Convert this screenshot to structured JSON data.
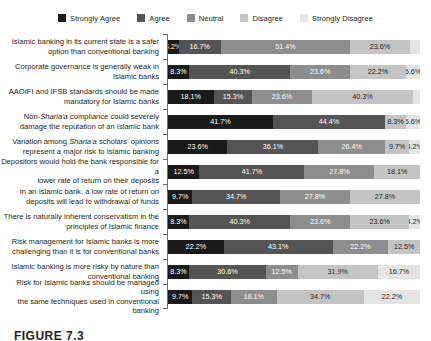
{
  "caption": "FIGURE 7.3",
  "legend": {
    "position": "top-center",
    "items": [
      {
        "label": "Strongly Agree",
        "color": "#1a1a1a"
      },
      {
        "label": "Agree",
        "color": "#545454"
      },
      {
        "label": "Neutral",
        "color": "#8d8d8d"
      },
      {
        "label": "Disagree",
        "color": "#c4c4c4"
      },
      {
        "label": "Strongly Disagree",
        "color": "#e4e4e4"
      }
    ]
  },
  "chart_data": {
    "type": "bar",
    "orientation": "horizontal",
    "stacked": true,
    "stacked_mode": "percent",
    "title": "",
    "xlabel": "",
    "ylabel": "",
    "xlim": [
      0,
      100
    ],
    "grid": false,
    "legend_position": "top-center",
    "series": [
      {
        "name": "Strongly Agree",
        "color": "#1a1a1a",
        "label_color": "#ffffff",
        "values": [
          4.2,
          8.3,
          18.1,
          41.7,
          23.6,
          12.5,
          9.7,
          8.3,
          22.2,
          8.3,
          9.7
        ]
      },
      {
        "name": "Agree",
        "color": "#545454",
        "label_color": "#ffffff",
        "values": [
          16.7,
          40.3,
          15.3,
          44.4,
          36.1,
          41.7,
          34.7,
          40.3,
          43.1,
          30.6,
          15.3
        ]
      },
      {
        "name": "Neutral",
        "color": "#8d8d8d",
        "label_color": "#ffffff",
        "values": [
          51.4,
          23.6,
          23.6,
          0.0,
          26.4,
          27.8,
          27.8,
          23.6,
          22.2,
          12.5,
          18.1
        ]
      },
      {
        "name": "Disagree",
        "color": "#c4c4c4",
        "label_color": "#231f20",
        "values": [
          23.6,
          22.2,
          40.3,
          8.3,
          9.7,
          18.1,
          27.8,
          23.6,
          12.5,
          31.9,
          34.7
        ]
      },
      {
        "name": "Strongly Disagree",
        "color": "#e4e4e4",
        "label_color": "#231f20",
        "values": [
          4.1,
          5.6,
          2.7,
          5.6,
          4.2,
          0.0,
          0.0,
          4.2,
          0.0,
          16.7,
          22.2
        ]
      }
    ],
    "categories": [
      "Islamic banking in its current state is a safer option than conventional banking",
      "Corporate governance is generally weak in Islamic banks",
      "AAOIFI and IFSB standards should be made mandatory for Islamic banks",
      "Non-Sharia'a compliance could severely damage the reputation of an Islamic bank",
      "Variation among Sharia'a scholars' opinions represent a major risk to Islamic banking",
      "Depositors would hold the bank responsible for a lower rate of return on their deposits",
      "In an Islamic bank, a low rate of return on deposits will lead to withdrawal of funds",
      "There is naturally inherent conservatism in the principles of Islamic finance",
      "Risk management for Islamic banks is more challenging than it is for conventional banks",
      "Islamic banking is more risky by nature than conventional banking",
      "Risk for Islamic banks should be managed using the same techniques used in conventional banking"
    ]
  },
  "rows": [
    {
      "label_html": "Islamic banking in its current state is a safer<br>option than conventional banking",
      "segments": [
        {
          "series": "Strongly Agree",
          "value": 4.2,
          "text": "4.2%"
        },
        {
          "series": "Agree",
          "value": 16.7,
          "text": "16.7%"
        },
        {
          "series": "Neutral",
          "value": 51.4,
          "text": "51.4%"
        },
        {
          "series": "Disagree",
          "value": 23.6,
          "text": "23.6%"
        },
        {
          "series": "Strongly Disagree",
          "value": 4.1,
          "text": ""
        }
      ]
    },
    {
      "label_html": "Corporate governance is generally weak in<br>Islamic banks",
      "segments": [
        {
          "series": "Strongly Agree",
          "value": 8.3,
          "text": "8.3%"
        },
        {
          "series": "Agree",
          "value": 40.3,
          "text": "40.3%"
        },
        {
          "series": "Neutral",
          "value": 23.6,
          "text": "23.6%"
        },
        {
          "series": "Disagree",
          "value": 22.2,
          "text": "22.2%"
        },
        {
          "series": "Strongly Disagree",
          "value": 5.6,
          "text": "5.6%"
        }
      ]
    },
    {
      "label_html": "AAOIFI and IFSB standards should be made<br>mandatory for Islamic banks",
      "segments": [
        {
          "series": "Strongly Agree",
          "value": 18.1,
          "text": "18.1%"
        },
        {
          "series": "Agree",
          "value": 15.3,
          "text": "15.3%"
        },
        {
          "series": "Neutral",
          "value": 23.6,
          "text": "23.6%"
        },
        {
          "series": "Disagree",
          "value": 40.3,
          "text": "40.3%"
        },
        {
          "series": "Strongly Disagree",
          "value": 2.7,
          "text": ""
        }
      ]
    },
    {
      "label_html": "Non-<i>Sharia'a</i> compliance could severely<br>damage the reputation of an Islamic bank",
      "segments": [
        {
          "series": "Strongly Agree",
          "value": 41.7,
          "text": "41.7%"
        },
        {
          "series": "Agree",
          "value": 44.4,
          "text": "44.4%"
        },
        {
          "series": "Disagree",
          "value": 8.3,
          "text": "8.3%"
        },
        {
          "series": "Strongly Disagree",
          "value": 5.6,
          "text": "5.6%"
        }
      ]
    },
    {
      "label_html": "Variation among <i>Sharia'a</i> scholars' opinions<br>represent a major risk to Islamic banking",
      "segments": [
        {
          "series": "Strongly Agree",
          "value": 23.6,
          "text": "23.6%"
        },
        {
          "series": "Agree",
          "value": 36.1,
          "text": "36.1%"
        },
        {
          "series": "Neutral",
          "value": 26.4,
          "text": "26.4%"
        },
        {
          "series": "Disagree",
          "value": 9.7,
          "text": "9.7%"
        },
        {
          "series": "Strongly Disagree",
          "value": 4.2,
          "text": "4.2%"
        }
      ]
    },
    {
      "label_html": "Depositors would hold the bank responsible for a<br>lower rate of return on their deposits",
      "segments": [
        {
          "series": "Strongly Agree",
          "value": 12.5,
          "text": "12.5%"
        },
        {
          "series": "Agree",
          "value": 41.7,
          "text": "41.7%"
        },
        {
          "series": "Neutral",
          "value": 27.8,
          "text": "27.8%"
        },
        {
          "series": "Disagree",
          "value": 18.1,
          "text": "18.1%"
        }
      ]
    },
    {
      "label_html": "In an Islamic bank, a low rate of return on<br>deposits will lead to withdrawal of funds",
      "segments": [
        {
          "series": "Strongly Agree",
          "value": 9.7,
          "text": "9.7%"
        },
        {
          "series": "Agree",
          "value": 34.7,
          "text": "34.7%"
        },
        {
          "series": "Neutral",
          "value": 27.8,
          "text": "27.8%"
        },
        {
          "series": "Disagree",
          "value": 27.8,
          "text": "27.8%"
        }
      ]
    },
    {
      "label_html": "There is naturally inherent conservatism in the<br>principles of Islamic finance",
      "segments": [
        {
          "series": "Strongly Agree",
          "value": 8.3,
          "text": "8.3%"
        },
        {
          "series": "Agree",
          "value": 40.3,
          "text": "40.3%"
        },
        {
          "series": "Neutral",
          "value": 23.6,
          "text": "23.6%"
        },
        {
          "series": "Disagree",
          "value": 23.6,
          "text": "23.6%"
        },
        {
          "series": "Strongly Disagree",
          "value": 4.2,
          "text": "4.2%"
        }
      ]
    },
    {
      "label_html": "Risk management for Islamic banks is more<br>challenging than it is for conventional banks",
      "segments": [
        {
          "series": "Strongly Agree",
          "value": 22.2,
          "text": "22.2%"
        },
        {
          "series": "Agree",
          "value": 43.1,
          "text": "43.1%"
        },
        {
          "series": "Neutral",
          "value": 22.2,
          "text": "22.2%"
        },
        {
          "series": "Disagree",
          "value": 12.5,
          "text": "12.5%"
        }
      ]
    },
    {
      "label_html": "Islamic banking is more risky by nature than<br>conventional banking",
      "segments": [
        {
          "series": "Strongly Agree",
          "value": 8.3,
          "text": "8.3%"
        },
        {
          "series": "Agree",
          "value": 30.6,
          "text": "30.6%"
        },
        {
          "series": "Neutral",
          "value": 12.5,
          "text": "12.5%"
        },
        {
          "series": "Disagree",
          "value": 31.9,
          "text": "31.9%"
        },
        {
          "series": "Strongly Disagree",
          "value": 16.7,
          "text": "16.7%"
        }
      ]
    },
    {
      "label_html": "Risk for Islamic banks should be managed using<br>the same techniques used in conventional banking",
      "segments": [
        {
          "series": "Strongly Agree",
          "value": 9.7,
          "text": "9.7%"
        },
        {
          "series": "Agree",
          "value": 15.3,
          "text": "15.3%"
        },
        {
          "series": "Neutral",
          "value": 18.1,
          "text": "18.1%"
        },
        {
          "series": "Disagree",
          "value": 34.7,
          "text": "34.7%"
        },
        {
          "series": "Strongly Disagree",
          "value": 22.2,
          "text": "22.2%"
        }
      ]
    }
  ]
}
